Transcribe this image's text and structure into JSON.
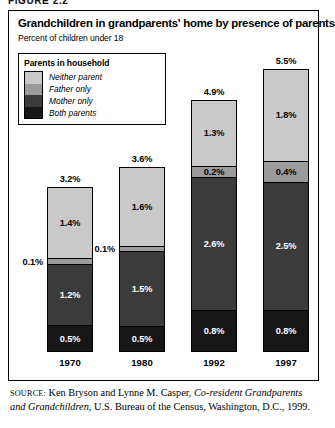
{
  "figure_caption": "FIGURE 2.2",
  "chart": {
    "title": "Grandchildren in grandparents' home by presence of parents",
    "subtitle": "Percent of children under 18"
  },
  "legend": {
    "title": "Parents in household",
    "items": [
      {
        "label": "Neither parent",
        "color": "#c9c9c9"
      },
      {
        "label": "Father only",
        "color": "#9b9b9b"
      },
      {
        "label": "Mother only",
        "color": "#3b3b3b"
      },
      {
        "label": "Both parents",
        "color": "#171717"
      }
    ]
  },
  "source": {
    "label": "SOURCE:",
    "text_1": " Ken Bryson and Lynne M. Casper, ",
    "text_italic": "Co-resident Grandparents and Grandchildren",
    "text_2": ", U.S. Bureau of the Census, Washington, D.C., 1999."
  },
  "chart_data": {
    "type": "bar",
    "title": "Grandchildren in grandparents' home by presence of parents",
    "subtitle": "Percent of children under 18",
    "xlabel": "",
    "ylabel": "Percent of children under 18",
    "stacked": true,
    "grid": false,
    "legend_position": "top-left",
    "ylim": [
      0,
      5.5
    ],
    "categories": [
      "1970",
      "1980",
      "1992",
      "1997"
    ],
    "totals": [
      "3.2%",
      "3.6%",
      "4.9%",
      "5.5%"
    ],
    "totals_values": [
      3.2,
      3.6,
      4.9,
      5.5
    ],
    "series": [
      {
        "name": "Neither parent",
        "color": "#c9c9c9",
        "values": [
          1.4,
          1.6,
          1.3,
          1.8
        ],
        "labels": [
          "1.4%",
          "1.6%",
          "1.3%",
          "1.8%"
        ]
      },
      {
        "name": "Father only",
        "color": "#9b9b9b",
        "values": [
          0.1,
          0.1,
          0.2,
          0.4
        ],
        "labels": [
          "0.1%",
          "0.1%",
          "0.2%",
          "0.4%"
        ]
      },
      {
        "name": "Mother only",
        "color": "#3b3b3b",
        "values": [
          1.2,
          1.5,
          2.6,
          2.5
        ],
        "labels": [
          "1.2%",
          "1.5%",
          "2.6%",
          "2.5%"
        ]
      },
      {
        "name": "Both parents",
        "color": "#171717",
        "values": [
          0.5,
          0.5,
          0.8,
          0.8
        ],
        "labels": [
          "0.5%",
          "0.5%",
          "0.8%",
          "0.8%"
        ]
      }
    ]
  }
}
